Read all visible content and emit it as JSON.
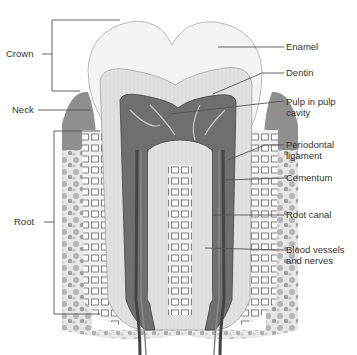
{
  "figure": {
    "colors": {
      "background": "#ffffff",
      "line": "#555555",
      "enamel": "#f3f3f3",
      "dentin": "#e0e0e0",
      "pulp": "#7a7a7a",
      "bone": "#d4d4d4",
      "gum": "#9a9a9a",
      "text": "#333333"
    }
  },
  "labels": {
    "left": [
      {
        "id": "crown",
        "text": "Crown"
      },
      {
        "id": "neck",
        "text": "Neck"
      },
      {
        "id": "root",
        "text": "Root"
      }
    ],
    "right": [
      {
        "id": "enamel",
        "text": "Enamel"
      },
      {
        "id": "dentin",
        "text": "Dentin"
      },
      {
        "id": "pulp",
        "line1": "Pulp in pulp",
        "line2": "cavity"
      },
      {
        "id": "periodontal",
        "line1": "Periodontal",
        "line2": "ligament"
      },
      {
        "id": "cementum",
        "text": "Cementum"
      },
      {
        "id": "root-canal",
        "text": "Root canal"
      },
      {
        "id": "blood-vessels",
        "line1": "Blood vessels",
        "line2": "and nerves"
      }
    ]
  }
}
